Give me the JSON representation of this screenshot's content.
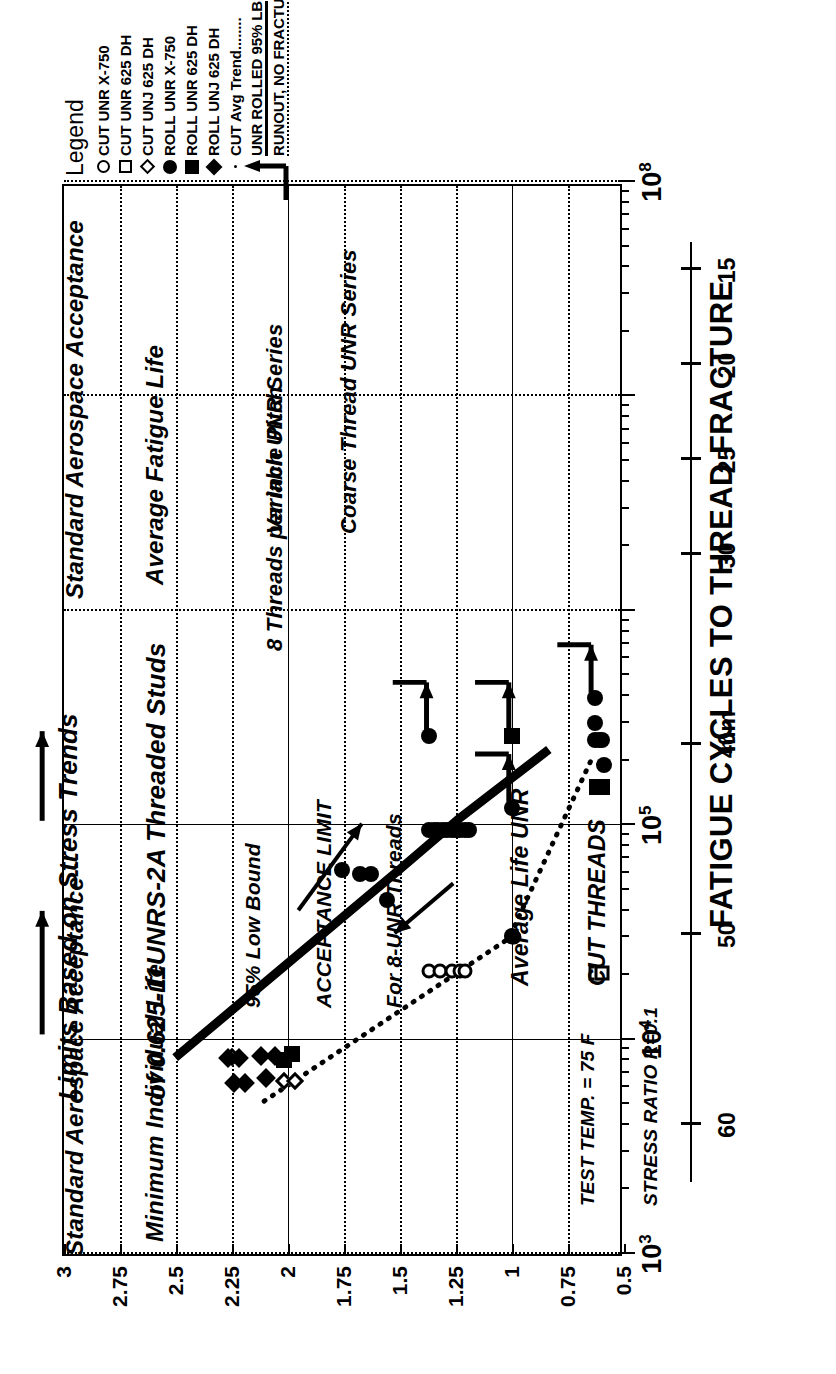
{
  "figure": {
    "title_lines": [
      "Limits Based on Stress Trends",
      "of 0.625-11UNRS-2A Threaded Studs"
    ]
  },
  "legend": {
    "title": "Legend",
    "items": [
      {
        "symbol": "circle-open",
        "label": "CUT UNR X-750"
      },
      {
        "symbol": "square-open",
        "label": "CUT UNR 625 DH"
      },
      {
        "symbol": "diamond-open",
        "label": "CUT UNJ 625 DH"
      },
      {
        "symbol": "circle-fill",
        "label": "ROLL UNR X-750"
      },
      {
        "symbol": "square-fill",
        "label": "ROLL UNR 625 DH"
      },
      {
        "symbol": "diamond-fill",
        "label": "ROLL UNJ 625 DH"
      },
      {
        "symbol": "dotted-line",
        "label": "CUT Avg Trend........"
      },
      {
        "symbol": "solid-line",
        "label": "UNR ROLLED 95% LB"
      },
      {
        "symbol": "runout-arrow",
        "label": "RUNOUT, NO FRACTURE"
      }
    ]
  },
  "chart_data": {
    "type": "scatter",
    "title": "Limits Based on Stress Trends of 0.625-11UNRS-2A Threaded Studs",
    "xlabel": "FATIGUE CYCLES TO THREAD FRACTURE",
    "ylabel": "BASIC THREAD DIAMETER, inches",
    "y2label": "mm",
    "xscale": "log",
    "xlim": [
      1000,
      100000000
    ],
    "ylim": [
      0.5,
      3
    ],
    "grid": true,
    "legend_position": "right-top",
    "xticklabels": [
      "10^3",
      "10^4",
      "10^5",
      "10^8"
    ],
    "yticklabels": [
      "3",
      "2.75",
      "2.5",
      "2.25",
      "2",
      "1.75",
      "1.5",
      "1.25",
      "1",
      "0.75",
      "0.5"
    ],
    "yticks": [
      3,
      2.75,
      2.5,
      2.25,
      2,
      1.75,
      1.5,
      1.25,
      1,
      0.75,
      0.5
    ],
    "y2ticklabels": [
      "60",
      "50",
      "40",
      "30",
      "25",
      "20",
      "15"
    ],
    "y2ticks": [
      60,
      50,
      40,
      30,
      25,
      20,
      15
    ],
    "series": [
      {
        "name": "CUT UNR X-750",
        "symbol": "circle-open",
        "points": [
          {
            "x": 21000,
            "y": 1.37
          },
          {
            "x": 21000,
            "y": 1.32
          },
          {
            "x": 21000,
            "y": 1.27
          },
          {
            "x": 21000,
            "y": 1.23
          },
          {
            "x": 21000,
            "y": 1.21
          },
          {
            "x": 30000,
            "y": 1.0
          },
          {
            "x": 30000,
            "y": 0.99
          }
        ]
      },
      {
        "name": "CUT UNR 625 DH",
        "symbol": "square-open",
        "points": [
          {
            "x": 20500,
            "y": 0.625
          },
          {
            "x": 20500,
            "y": 0.6
          }
        ]
      },
      {
        "name": "CUT UNJ 625 DH",
        "symbol": "diamond-open",
        "points": [
          {
            "x": 8300,
            "y": 2.25
          },
          {
            "x": 6400,
            "y": 2.02
          },
          {
            "x": 6400,
            "y": 1.97
          }
        ]
      },
      {
        "name": "ROLL UNR X-750",
        "symbol": "circle-fill",
        "points": [
          {
            "x": 62000,
            "y": 1.76
          },
          {
            "x": 59000,
            "y": 1.68
          },
          {
            "x": 59000,
            "y": 1.63
          },
          {
            "x": 45000,
            "y": 1.56
          },
          {
            "x": 260000,
            "y": 1.37
          },
          {
            "x": 95000,
            "y": 1.37
          },
          {
            "x": 95000,
            "y": 1.35
          },
          {
            "x": 95000,
            "y": 1.33
          },
          {
            "x": 95000,
            "y": 1.31
          },
          {
            "x": 95000,
            "y": 1.29
          },
          {
            "x": 95000,
            "y": 1.27
          },
          {
            "x": 95000,
            "y": 1.25
          },
          {
            "x": 95000,
            "y": 1.23
          },
          {
            "x": 95000,
            "y": 1.21
          },
          {
            "x": 95000,
            "y": 1.19
          },
          {
            "x": 120000,
            "y": 1.0
          },
          {
            "x": 30500,
            "y": 1.0
          },
          {
            "x": 390000,
            "y": 0.63
          },
          {
            "x": 300000,
            "y": 0.63
          },
          {
            "x": 250000,
            "y": 0.63
          },
          {
            "x": 250000,
            "y": 0.61
          },
          {
            "x": 250000,
            "y": 0.6
          },
          {
            "x": 190000,
            "y": 0.59
          }
        ]
      },
      {
        "name": "ROLL UNR 625 DH",
        "symbol": "square-fill",
        "points": [
          {
            "x": 260000,
            "y": 1.0
          },
          {
            "x": 150000,
            "y": 0.62
          },
          {
            "x": 150000,
            "y": 0.6
          },
          {
            "x": 8000,
            "y": 2.02
          },
          {
            "x": 8600,
            "y": 1.98
          }
        ]
      },
      {
        "name": "ROLL UNJ 625 DH",
        "symbol": "diamond-fill",
        "points": [
          {
            "x": 8200,
            "y": 2.27
          },
          {
            "x": 8200,
            "y": 2.22
          },
          {
            "x": 6300,
            "y": 2.24
          },
          {
            "x": 6300,
            "y": 2.19
          },
          {
            "x": 8400,
            "y": 2.12
          },
          {
            "x": 8400,
            "y": 2.06
          },
          {
            "x": 6600,
            "y": 2.1
          }
        ]
      }
    ],
    "lines": [
      {
        "name": "UNR ROLLED 95% LB",
        "style": "solid-thick",
        "points": [
          {
            "x": 8300,
            "y": 2.5
          },
          {
            "x": 62000,
            "y": 1.5
          },
          {
            "x": 110000,
            "y": 1.22
          },
          {
            "x": 230000,
            "y": 0.82
          }
        ]
      },
      {
        "name": "CUT Avg Trend",
        "style": "dotted",
        "points": [
          {
            "x": 5200,
            "y": 2.1
          },
          {
            "x": 30000,
            "y": 1.0
          },
          {
            "x": 205000,
            "y": 0.63
          }
        ]
      }
    ],
    "annotations": [
      {
        "text": "Standard Aerospace Acceptance\nAverage Fatigue Life",
        "near_x": 100000,
        "near_y": 2.9
      },
      {
        "text": "Standard Aerospace Acceptance---\nMinimum Individual Life",
        "near_x": 10000,
        "near_y": 2.9
      },
      {
        "text": "95% Low Bound\nACCEPTANCE LIMIT\nFor 8-UNR Threads",
        "near_x": 30000,
        "near_y": 1.6
      },
      {
        "text": "8 Threads per Inch UNR Series",
        "near_x": 250000,
        "near_y": 1.35
      },
      {
        "text": "Variable Pitch\nCoarse Thread UNR Series",
        "near_x": 400000,
        "near_y": 1.1
      },
      {
        "text": "Average Life UNR\nCUT THREADS",
        "near_x": 28000,
        "near_y": 0.85
      },
      {
        "text": "TEST TEMP. = 75 F\nSTRESS RATIO R=0.1",
        "near_x": 4000,
        "near_y": 0.6
      }
    ],
    "vertical_reference_lines": [
      {
        "x": 10000,
        "label": "Standard Aerospace Acceptance - Minimum Individual Life"
      },
      {
        "x": 100000,
        "label": "Standard Aerospace Acceptance - Average Fatigue Life"
      }
    ]
  },
  "annotations": {
    "std_avg": {
      "line1": "Standard Aerospace Acceptance",
      "line2": "Average Fatigue Life"
    },
    "std_min": {
      "line1": "Standard Aerospace Acceptance---",
      "line2": "Minimum Individual Life"
    },
    "accept_limit": {
      "line1": "95% Low Bound",
      "line2": "ACCEPTANCE LIMIT",
      "line3": "For 8-UNR Threads"
    },
    "eight_tpi": "8 Threads per Inch UNR Series",
    "variable_pitch": {
      "line1": "Variable Pitch",
      "line2": "Coarse Thread UNR Series"
    },
    "avg_life_cut": {
      "line1": "Average Life UNR",
      "line2": "CUT THREADS"
    },
    "test_conditions": {
      "line1": "TEST TEMP. = 75 F",
      "line2": "STRESS RATIO R=0.1"
    }
  },
  "axes": {
    "x_title": "FATIGUE CYCLES TO THREAD FRACTURE",
    "y_title": "BASIC THREAD DIAMETER, inches",
    "mm_title": "mm",
    "x_labels": [
      {
        "value": "10",
        "exp": "3"
      },
      {
        "value": "10",
        "exp": "4"
      },
      {
        "value": "10",
        "exp": "5"
      },
      {
        "value": "10",
        "exp": "8"
      }
    ],
    "y_labels": [
      "3",
      "2.75",
      "2.5",
      "2.25",
      "2",
      "1.75",
      "1.5",
      "1.25",
      "1",
      "0.75",
      "0.5"
    ],
    "mm_labels": [
      "60",
      "50",
      "40",
      "30",
      "25",
      "20",
      "15"
    ]
  }
}
